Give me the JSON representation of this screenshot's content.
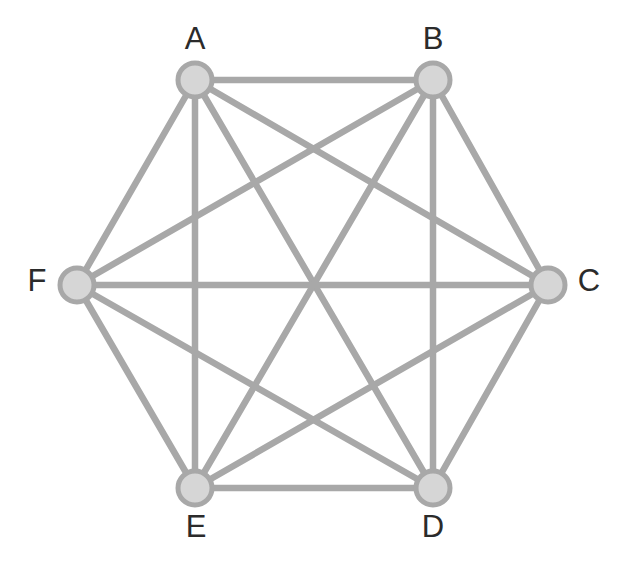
{
  "figure": {
    "background_color": "#ffffff",
    "edge_color": "#a8a8a8",
    "node_fill_color": "#d6d6d6",
    "node_stroke_color": "#a8a8a8",
    "label_color": "#2b2b2b",
    "edge_width": 6.5,
    "node_radius": 17
  },
  "chart_data": {
    "type": "diagram",
    "graph_type": "complete-graph",
    "title": "",
    "node_count": 6,
    "edge_count": 15,
    "nodes": [
      {
        "id": "A",
        "label": "A",
        "x": 195,
        "y": 80,
        "label_x": 195,
        "label_y": 41
      },
      {
        "id": "B",
        "label": "B",
        "x": 433,
        "y": 80,
        "label_x": 433,
        "label_y": 41
      },
      {
        "id": "C",
        "label": "C",
        "x": 548,
        "y": 285,
        "label_x": 589,
        "label_y": 283
      },
      {
        "id": "D",
        "label": "D",
        "x": 433,
        "y": 488,
        "label_x": 433,
        "label_y": 529
      },
      {
        "id": "E",
        "label": "E",
        "x": 195,
        "y": 488,
        "label_x": 196,
        "label_y": 529
      },
      {
        "id": "F",
        "label": "F",
        "x": 77,
        "y": 285,
        "label_x": 37,
        "label_y": 283
      }
    ],
    "edges": [
      {
        "source": "A",
        "target": "B"
      },
      {
        "source": "A",
        "target": "C"
      },
      {
        "source": "A",
        "target": "D"
      },
      {
        "source": "A",
        "target": "E"
      },
      {
        "source": "A",
        "target": "F"
      },
      {
        "source": "B",
        "target": "C"
      },
      {
        "source": "B",
        "target": "D"
      },
      {
        "source": "B",
        "target": "E"
      },
      {
        "source": "B",
        "target": "F"
      },
      {
        "source": "C",
        "target": "D"
      },
      {
        "source": "C",
        "target": "E"
      },
      {
        "source": "C",
        "target": "F"
      },
      {
        "source": "D",
        "target": "E"
      },
      {
        "source": "D",
        "target": "F"
      },
      {
        "source": "E",
        "target": "F"
      }
    ]
  }
}
